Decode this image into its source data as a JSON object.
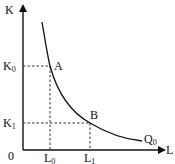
{
  "diagram": {
    "type": "isoquant",
    "axes": {
      "y_label": "K",
      "x_label": "L",
      "origin_label": "0"
    },
    "y_ticks": [
      {
        "base": "K",
        "sub": "0"
      },
      {
        "base": "K",
        "sub": "1"
      }
    ],
    "x_ticks": [
      {
        "base": "L",
        "sub": "0"
      },
      {
        "base": "L",
        "sub": "1"
      }
    ],
    "points": [
      {
        "label": "A",
        "L": "L0",
        "K": "K0"
      },
      {
        "label": "B",
        "L": "L1",
        "K": "K1"
      }
    ],
    "curve": {
      "base": "Q",
      "sub": "0"
    },
    "colors": {
      "line": "#111111",
      "guides": "#333333"
    }
  }
}
